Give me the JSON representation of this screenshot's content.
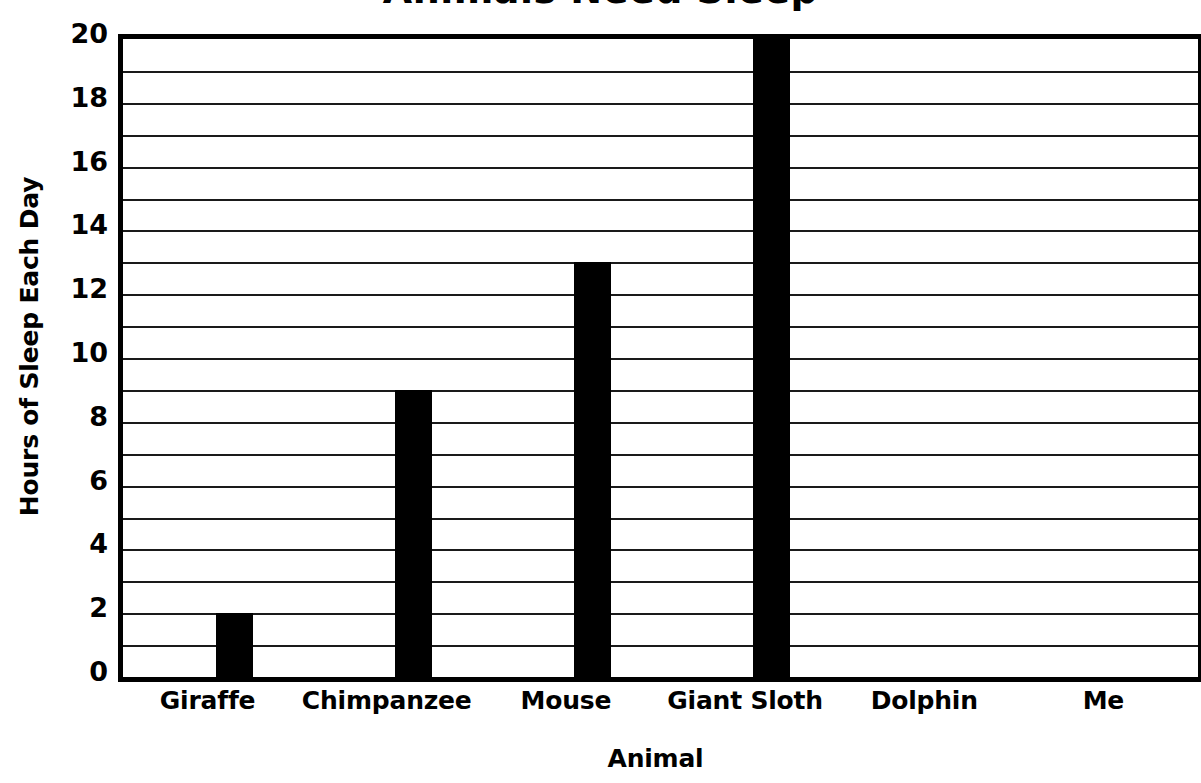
{
  "chart_data": {
    "type": "bar",
    "title": "Animals Need Sleep",
    "xlabel": "Animal",
    "ylabel": "Hours of Sleep Each Day",
    "categories": [
      "Giraffe",
      "Chimpanzee",
      "Mouse",
      "Giant Sloth",
      "Dolphin",
      "Me"
    ],
    "values": [
      2,
      9,
      13,
      20,
      0,
      0
    ],
    "ylim": [
      0,
      20
    ],
    "ytick_labels": [
      "20",
      "18",
      "16",
      "14",
      "12",
      "10",
      "8",
      "6",
      "4",
      "2",
      "0"
    ],
    "ytick_values": [
      20,
      18,
      16,
      14,
      12,
      10,
      8,
      6,
      4,
      2,
      0
    ],
    "y_major_step": 2,
    "y_minor_step": 1,
    "grid": true,
    "grid_axis": "y",
    "legend": false,
    "bar_color": "#000000",
    "background_color": "#ffffff",
    "axis_color": "#000000"
  }
}
